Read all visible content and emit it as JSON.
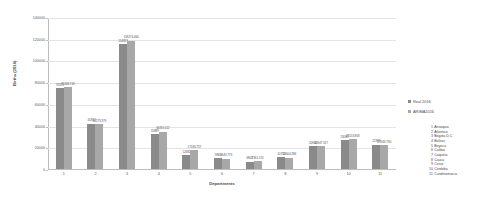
{
  "chart_data": {
    "type": "bar",
    "title": "",
    "xlabel": "Departments",
    "ylabel": "Births (2016)",
    "ylim": [
      0,
      140000
    ],
    "yticks": [
      0,
      20000,
      40000,
      60000,
      80000,
      100000,
      120000,
      140000
    ],
    "ytick_labels": [
      "0",
      "20000",
      "40000",
      "60000",
      "80000",
      "100000",
      "120000",
      "140000"
    ],
    "grid": true,
    "legend_position": "right",
    "categories": [
      "1",
      "2",
      "3",
      "4",
      "5",
      "6",
      "7",
      "8",
      "9",
      "10",
      "11"
    ],
    "series": [
      {
        "name": "Real 2016",
        "color": "#8a8a8a",
        "values": [
          74370,
          41832,
          114823,
          31889,
          12682,
          9861,
          6802,
          10712,
          20940,
          26589,
          22389
        ],
        "labels": [
          "74370",
          "41832",
          "114823",
          "31889",
          "12682",
          "9861",
          "6802",
          "10712",
          "20940",
          "26589",
          "22389"
        ]
      },
      {
        "name": "ARIMA2016",
        "color": "#a8a8a8",
        "values": [
          75348.7,
          41173.37,
          118274.46,
          34416.11,
          17180.757,
          9643.773,
          7361.191,
          10604.384,
          20947.317,
          27553.858,
          21943.73
        ],
        "labels": [
          "75348.749",
          "41173.379",
          "118274.460",
          "34416.112",
          "17180.757",
          "9643.773",
          "7361.191",
          "10604.384",
          "20947.317",
          "27553.858",
          "21943.730"
        ]
      }
    ]
  },
  "legend": {
    "series": [
      {
        "label": "Real 2016"
      },
      {
        "label": "ARIMA2016"
      }
    ],
    "departments": [
      {
        "num": "1",
        "name": "Antioquia"
      },
      {
        "num": "2",
        "name": "Atlantico"
      },
      {
        "num": "3",
        "name": "Bogota D.C"
      },
      {
        "num": "4",
        "name": "Bolivar"
      },
      {
        "num": "5",
        "name": "Boyaca"
      },
      {
        "num": "6",
        "name": "Caldas"
      },
      {
        "num": "7",
        "name": "Caqueta"
      },
      {
        "num": "8",
        "name": "Cauca"
      },
      {
        "num": "9",
        "name": "Cesar"
      },
      {
        "num": "10",
        "name": "Cordoba"
      },
      {
        "num": "11",
        "name": "Cundinamarca"
      }
    ]
  }
}
